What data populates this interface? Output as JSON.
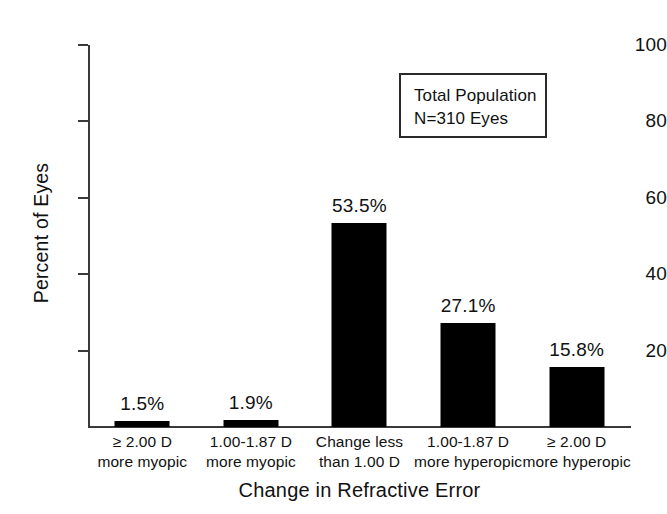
{
  "chart_data": {
    "type": "bar",
    "title": "",
    "xlabel": "Change in Refractive Error",
    "ylabel": "Percent of Eyes",
    "ylim": [
      0,
      100
    ],
    "yticks": [
      20,
      40,
      60,
      80,
      100
    ],
    "ytick_labels": [
      "20",
      "40",
      "60",
      "80",
      "100"
    ],
    "grid": false,
    "legend_position": "upper-right-inset",
    "bar_color": "#000000",
    "categories": [
      "≥ 2.00 D more myopic",
      "1.00-1.87 D more myopic",
      "Change less than 1.00 D",
      "1.00-1.87 D more hyperopic",
      "≥ 2.00 D more hyperopic"
    ],
    "category_lines": [
      [
        "≥ 2.00 D",
        "more myopic"
      ],
      [
        "1.00-1.87 D",
        "more myopic"
      ],
      [
        "Change less",
        "than 1.00 D"
      ],
      [
        "1.00-1.87 D",
        "more hyperopic"
      ],
      [
        "≥ 2.00 D",
        "more hyperopic"
      ]
    ],
    "values": [
      1.5,
      1.9,
      53.5,
      27.1,
      15.8
    ],
    "value_labels": [
      "1.5%",
      "1.9%",
      "53.5%",
      "27.1%",
      "15.8%"
    ],
    "annotations": [
      {
        "line1": "Total Population",
        "line2": "N=310 Eyes"
      }
    ]
  },
  "legend": {
    "line1": "Total Population",
    "line2": "N=310 Eyes"
  }
}
